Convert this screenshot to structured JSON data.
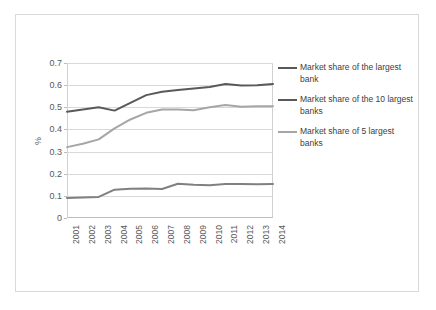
{
  "chart_data": {
    "type": "line",
    "title": "",
    "subtitle": "",
    "xlabel": "",
    "ylabel": "%",
    "categories": [
      "2001",
      "2002",
      "2003",
      "2004",
      "2005",
      "2006",
      "2007",
      "2008",
      "2009",
      "2010",
      "2011",
      "2012",
      "2013",
      "2014"
    ],
    "ylim": [
      0,
      0.7
    ],
    "yticks": [
      "0",
      "0.1",
      "0.2",
      "0.3",
      "0.4",
      "0.5",
      "0.6",
      "0.7"
    ],
    "ytick_values": [
      0,
      0.1,
      0.2,
      0.3,
      0.4,
      0.5,
      0.6,
      0.7
    ],
    "grid": true,
    "legend_position": "right",
    "series": [
      {
        "name": "Market share of the largest bank",
        "color": "#808080",
        "values": [
          0.09,
          0.093,
          0.095,
          0.128,
          0.132,
          0.133,
          0.131,
          0.155,
          0.15,
          0.148,
          0.153,
          0.153,
          0.152,
          0.153
        ]
      },
      {
        "name": "Market share of the 10 largest banks",
        "color": "#595959",
        "values": [
          0.48,
          0.49,
          0.5,
          0.485,
          0.52,
          0.555,
          0.57,
          0.578,
          0.585,
          0.592,
          0.605,
          0.598,
          0.6,
          0.605
        ]
      },
      {
        "name": "Market share of 5 largest banks",
        "color": "#a6a6a6",
        "values": [
          0.32,
          0.335,
          0.355,
          0.405,
          0.445,
          0.475,
          0.49,
          0.49,
          0.487,
          0.5,
          0.51,
          0.502,
          0.505,
          0.505
        ]
      }
    ]
  },
  "legend": {
    "items": [
      {
        "label": "Market share of the largest bank",
        "color": "#595959"
      },
      {
        "label": "Market share of the 10 largest banks",
        "color": "#595959"
      },
      {
        "label": "Market share of 5 largest banks",
        "color": "#a6a6a6"
      }
    ]
  }
}
